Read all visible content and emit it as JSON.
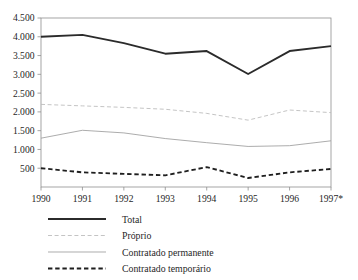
{
  "chart_data": {
    "type": "line",
    "title": "",
    "subtitle": "",
    "xlabel": "",
    "ylabel": "",
    "x": [
      "1990",
      "1991",
      "1992",
      "1993",
      "1994",
      "1995",
      "1996",
      "1997*"
    ],
    "categories": [
      "1990",
      "1991",
      "1992",
      "1993",
      "1994",
      "1995",
      "1996",
      "1997*"
    ],
    "ylim": [
      0,
      4500
    ],
    "yticks": [
      500,
      1000,
      1500,
      2000,
      2500,
      3000,
      3500,
      4000,
      4500
    ],
    "ytick_labels": [
      "500",
      "1.000",
      "1.500",
      "2.000",
      "2.500",
      "3.000",
      "3.500",
      "4.000",
      "4.500"
    ],
    "xtick_labels": [
      "1990",
      "1991",
      "1992",
      "1993",
      "1994",
      "1995",
      "1996",
      "1997*"
    ],
    "grid": false,
    "legend_position": "below",
    "series": [
      {
        "name": "Total",
        "style": "solid-thick",
        "color": "#2b2b2b",
        "values": [
          4000,
          4050,
          3830,
          3550,
          3620,
          3010,
          3620,
          3750
        ]
      },
      {
        "name": "Próprio",
        "style": "dashed-light",
        "color": "#b9b9b9",
        "values": [
          2200,
          2160,
          2120,
          2070,
          1960,
          1780,
          2050,
          1980
        ]
      },
      {
        "name": "Contratado permanente",
        "style": "solid-thin",
        "color": "#9d9d9d",
        "values": [
          1300,
          1510,
          1440,
          1290,
          1180,
          1080,
          1100,
          1230
        ]
      },
      {
        "name": "Contratado temporário",
        "style": "dashed-dark",
        "color": "#1f1f1f",
        "values": [
          500,
          390,
          350,
          310,
          530,
          240,
          390,
          480
        ]
      }
    ],
    "legend": [
      {
        "label": "Total",
        "style": "solid-thick",
        "color": "#2b2b2b"
      },
      {
        "label": "Próprio",
        "style": "dashed-light",
        "color": "#b9b9b9"
      },
      {
        "label": "Contratado permanente",
        "style": "solid-thin",
        "color": "#9d9d9d"
      },
      {
        "label": "Contratado temporário",
        "style": "dashed-dark",
        "color": "#1f1f1f"
      }
    ],
    "annotations": [],
    "axis_color": "#8e8e8e"
  }
}
